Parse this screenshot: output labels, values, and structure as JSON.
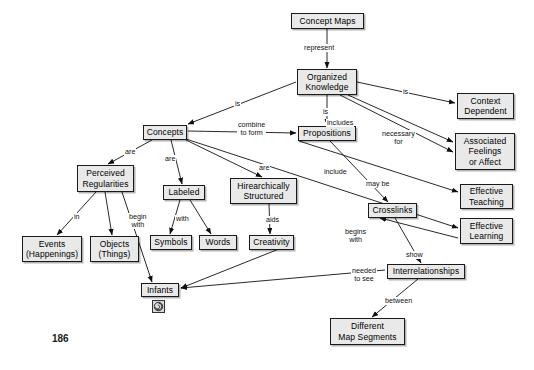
{
  "page": {
    "page_number": "186",
    "background_color": "#ffffff",
    "node_fill_color": "#e9e9e9",
    "node_border_color": "#1a1a1a",
    "link_color": "#111111"
  },
  "nodes": [
    {
      "id": "concept_maps",
      "label": "Concept Maps",
      "x": 291,
      "y": 13,
      "w": 73,
      "h": 16
    },
    {
      "id": "organized_knowledge",
      "label": "Organized\nKnowledge",
      "x": 297,
      "y": 69,
      "w": 60,
      "h": 26
    },
    {
      "id": "context_dependent",
      "label": "Context\nDependent",
      "x": 457,
      "y": 93,
      "w": 57,
      "h": 26
    },
    {
      "id": "concepts",
      "label": "Concepts",
      "x": 143,
      "y": 125,
      "w": 44,
      "h": 15
    },
    {
      "id": "propositions",
      "label": "Propositions",
      "x": 298,
      "y": 126,
      "w": 58,
      "h": 15
    },
    {
      "id": "associated_feelings",
      "label": "Associated\nFeelings\nor Affect",
      "x": 455,
      "y": 133,
      "w": 60,
      "h": 37
    },
    {
      "id": "perceived_regularities",
      "label": "Perceived\nRegularities",
      "x": 77,
      "y": 165,
      "w": 57,
      "h": 27
    },
    {
      "id": "effective_teaching",
      "label": "Effective\nTeaching",
      "x": 460,
      "y": 184,
      "w": 53,
      "h": 25
    },
    {
      "id": "labeled",
      "label": "Labeled",
      "x": 163,
      "y": 185,
      "w": 42,
      "h": 15
    },
    {
      "id": "hierarchically_structured",
      "label": "Hirearchically\nStructured",
      "x": 230,
      "y": 178,
      "w": 67,
      "h": 26
    },
    {
      "id": "crosslinks",
      "label": "Crosslinks",
      "x": 368,
      "y": 203,
      "w": 49,
      "h": 15
    },
    {
      "id": "effective_learning",
      "label": "Effective\nLearning",
      "x": 460,
      "y": 218,
      "w": 53,
      "h": 26
    },
    {
      "id": "events_happenings",
      "label": "Events\n(Happenings)",
      "x": 22,
      "y": 236,
      "w": 60,
      "h": 26
    },
    {
      "id": "objects_things",
      "label": "Objects\n(Things)",
      "x": 90,
      "y": 236,
      "w": 49,
      "h": 26
    },
    {
      "id": "symbols",
      "label": "Symbols",
      "x": 150,
      "y": 235,
      "w": 42,
      "h": 15
    },
    {
      "id": "words",
      "label": "Words",
      "x": 199,
      "y": 235,
      "w": 38,
      "h": 15
    },
    {
      "id": "creativity",
      "label": "Creativity",
      "x": 249,
      "y": 235,
      "w": 45,
      "h": 15
    },
    {
      "id": "interrelationships",
      "label": "Interrelationships",
      "x": 387,
      "y": 264,
      "w": 78,
      "h": 15
    },
    {
      "id": "infants",
      "label": "Infants",
      "x": 141,
      "y": 283,
      "w": 38,
      "h": 14
    },
    {
      "id": "different_map_segments",
      "label": "Different\nMap Segments",
      "x": 330,
      "y": 318,
      "w": 75,
      "h": 27
    }
  ],
  "links": [
    {
      "id": "l1",
      "from": "concept_maps",
      "to": "organized_knowledge",
      "label": "represent",
      "lx": 303,
      "ly": 44,
      "x1": 327,
      "y1": 29,
      "x2": 327,
      "y2": 68
    },
    {
      "id": "l2",
      "from": "organized_knowledge",
      "to": "context_dependent",
      "label": "is",
      "lx": 402,
      "ly": 88,
      "x1": 357,
      "y1": 82,
      "x2": 455,
      "y2": 103
    },
    {
      "id": "l3",
      "from": "organized_knowledge",
      "to": "concepts",
      "label": "is",
      "lx": 234,
      "ly": 100,
      "x1": 296,
      "y1": 82,
      "x2": 188,
      "y2": 124
    },
    {
      "id": "l4",
      "from": "organized_knowledge",
      "to": "propositions",
      "label": "is",
      "lx": 322,
      "ly": 108,
      "x1": 327,
      "y1": 95,
      "x2": 327,
      "y2": 125
    },
    {
      "id": "l5",
      "from": "organized_knowledge",
      "to": "associated_feelings",
      "label": "includes",
      "lx": 326,
      "ly": 119,
      "x1": 348,
      "y1": 95,
      "x2": 453,
      "y2": 142
    },
    {
      "id": "l6",
      "from": "organized_knowledge",
      "to": "associated_feelings",
      "label": "necessary\nfor",
      "lx": 381,
      "ly": 130,
      "x1": 340,
      "y1": 95,
      "x2": 453,
      "y2": 152
    },
    {
      "id": "l7",
      "from": "concepts",
      "to": "propositions",
      "label": "combine\nto form",
      "lx": 237,
      "ly": 121,
      "x1": 188,
      "y1": 131,
      "x2": 296,
      "y2": 133
    },
    {
      "id": "l8",
      "from": "concepts",
      "to": "perceived_regularities",
      "label": "are",
      "lx": 124,
      "ly": 148,
      "x1": 152,
      "y1": 140,
      "x2": 108,
      "y2": 164
    },
    {
      "id": "l9",
      "from": "concepts",
      "to": "labeled",
      "label": "are",
      "lx": 164,
      "ly": 155,
      "x1": 171,
      "y1": 140,
      "x2": 182,
      "y2": 184
    },
    {
      "id": "l10",
      "from": "concepts",
      "to": "hierarchically_structured",
      "label": "are",
      "lx": 258,
      "ly": 164,
      "x1": 186,
      "y1": 140,
      "x2": 262,
      "y2": 177
    },
    {
      "id": "l11",
      "from": "concepts",
      "to": "effective_learning",
      "label": "",
      "lx": 0,
      "ly": 0,
      "x1": 186,
      "y1": 139,
      "x2": 458,
      "y2": 228
    },
    {
      "id": "l12",
      "from": "propositions",
      "to": "effective_teaching",
      "label": "include",
      "lx": 323,
      "ly": 168,
      "x1": 299,
      "y1": 141,
      "x2": 458,
      "y2": 192
    },
    {
      "id": "l13",
      "from": "propositions",
      "to": "crosslinks",
      "label": "may be",
      "lx": 365,
      "ly": 180,
      "x1": 330,
      "y1": 141,
      "x2": 388,
      "y2": 202
    },
    {
      "id": "l14",
      "from": "perceived_regularities",
      "to": "events_happenings",
      "label": "in",
      "lx": 73,
      "ly": 213,
      "x1": 96,
      "y1": 192,
      "x2": 57,
      "y2": 235
    },
    {
      "id": "l15",
      "from": "perceived_regularities",
      "to": "objects_things",
      "label": "",
      "lx": 0,
      "ly": 0,
      "x1": 105,
      "y1": 192,
      "x2": 112,
      "y2": 235
    },
    {
      "id": "l16",
      "from": "perceived_regularities",
      "to": "infants",
      "label": "begin\nwith",
      "lx": 128,
      "ly": 213,
      "x1": 122,
      "y1": 192,
      "x2": 152,
      "y2": 282
    },
    {
      "id": "l17",
      "from": "labeled",
      "to": "symbols",
      "label": "with",
      "lx": 175,
      "ly": 215,
      "x1": 180,
      "y1": 200,
      "x2": 170,
      "y2": 234
    },
    {
      "id": "l18",
      "from": "labeled",
      "to": "words",
      "label": "",
      "lx": 0,
      "ly": 0,
      "x1": 190,
      "y1": 200,
      "x2": 211,
      "y2": 234
    },
    {
      "id": "l19",
      "from": "hierarchically_structured",
      "to": "creativity",
      "label": "aids",
      "lx": 265,
      "ly": 216,
      "x1": 269,
      "y1": 204,
      "x2": 270,
      "y2": 234
    },
    {
      "id": "l20",
      "from": "crosslinks",
      "to": "interrelationships",
      "label": "show",
      "lx": 405,
      "ly": 251,
      "x1": 395,
      "y1": 218,
      "x2": 421,
      "y2": 263
    },
    {
      "id": "l21",
      "from": "effective_learning",
      "to": "crosslinks",
      "label": "begins\nwith",
      "lx": 344,
      "ly": 228,
      "x1": 458,
      "y1": 238,
      "x2": 380,
      "y2": 218
    },
    {
      "id": "l22",
      "from": "interrelationships",
      "to": "infants",
      "label": "needed\nto see",
      "lx": 351,
      "ly": 267,
      "x1": 385,
      "y1": 270,
      "x2": 181,
      "y2": 288
    },
    {
      "id": "l23",
      "from": "interrelationships",
      "to": "different_map_segments",
      "label": "between",
      "lx": 384,
      "ly": 297,
      "x1": 418,
      "y1": 279,
      "x2": 372,
      "y2": 317
    },
    {
      "id": "l24",
      "from": "creativity",
      "to": "infants",
      "label": "",
      "lx": 0,
      "ly": 0,
      "x1": 294,
      "y1": 243,
      "x2": 181,
      "y2": 288
    }
  ],
  "icons": {
    "infants_badge": {
      "name": "spiral-badge-icon",
      "x": 152,
      "y": 299,
      "size": 13
    }
  }
}
